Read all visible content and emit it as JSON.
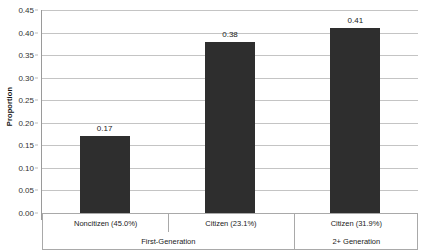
{
  "chart_data": {
    "type": "bar",
    "title": "",
    "xlabel": "",
    "ylabel": "Proportion",
    "ylim": [
      0.0,
      0.45
    ],
    "ytick_step": 0.05,
    "grid": true,
    "legend": null,
    "bar_color": "#2e2e2e",
    "gridline_color": "#c4c4c4",
    "categories": [
      "Noncitizen (45.0%)",
      "Citizen (23.1%)",
      "Citizen (31.9%)"
    ],
    "values": [
      0.17,
      0.38,
      0.41
    ],
    "value_labels": [
      "0.17",
      "0.38",
      "0.41"
    ],
    "group_labels": [
      "First-Generation",
      "2+ Generation"
    ],
    "group_spans": [
      2,
      1
    ],
    "ytick_labels": [
      "0.00",
      "0.05",
      "0.10",
      "0.15",
      "0.20",
      "0.25",
      "0.30",
      "0.35",
      "0.40",
      "0.45"
    ],
    "ytick_values": [
      0.0,
      0.05,
      0.1,
      0.15,
      0.2,
      0.25,
      0.3,
      0.35,
      0.4,
      0.45
    ]
  }
}
